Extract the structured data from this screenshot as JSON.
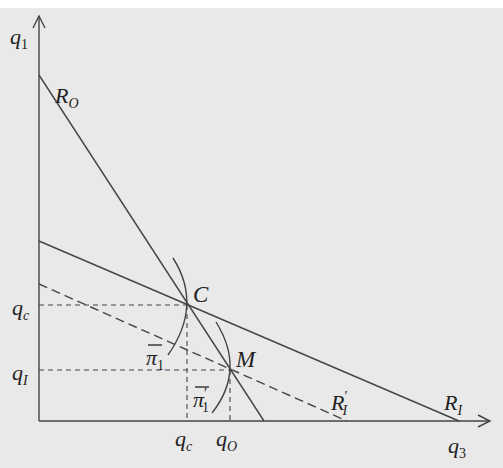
{
  "diagram": {
    "colors": {
      "background": "#e9e9e9",
      "ink": "#444444",
      "text": "#222222"
    },
    "axes": {
      "y_label": "q1",
      "x_label": "q3",
      "origin": [
        39,
        421
      ],
      "y_tip": [
        39,
        16
      ],
      "x_tip": [
        490,
        421
      ]
    },
    "lines": [
      {
        "id": "R_O",
        "label_main": "R",
        "label_sub": "O",
        "style": "solid",
        "from": [
          39,
          75
        ],
        "to": [
          264,
          421
        ],
        "label_pos": [
          52,
          103
        ]
      },
      {
        "id": "R_I",
        "label_main": "R",
        "label_sub": "I",
        "style": "solid",
        "from": [
          39,
          241
        ],
        "to": [
          459,
          421
        ],
        "label_pos": [
          444,
          410
        ]
      },
      {
        "id": "R_I_prime",
        "label_main": "R",
        "label_sub": "I",
        "label_prime": "′",
        "style": "dashed",
        "from": [
          39,
          284
        ],
        "to": [
          347,
          421
        ],
        "label_pos": [
          331,
          410
        ]
      }
    ],
    "points": [
      {
        "id": "C",
        "label": "C",
        "pos": [
          187,
          305
        ],
        "label_pos": [
          193,
          302
        ]
      },
      {
        "id": "M",
        "label": "M",
        "pos": [
          230,
          370
        ],
        "label_pos": [
          236,
          367
        ]
      }
    ],
    "guides": [
      {
        "from": [
          39,
          305
        ],
        "to": [
          187,
          305
        ]
      },
      {
        "from": [
          187,
          305
        ],
        "to": [
          187,
          421
        ]
      },
      {
        "from": [
          39,
          370
        ],
        "to": [
          230,
          370
        ]
      },
      {
        "from": [
          230,
          370
        ],
        "to": [
          230,
          421
        ]
      }
    ],
    "arcs": [
      {
        "id": "pi1",
        "label": "π",
        "label_sub": "1",
        "path": "M173,258 Q203,305 168,355",
        "label_pos": [
          146,
          365
        ]
      },
      {
        "id": "pi1_prime",
        "label": "π",
        "label_sub": "1",
        "label_prime": "′",
        "path": "M216,322 Q246,370 212,413",
        "label_pos": [
          193,
          407
        ]
      }
    ],
    "y_ticks": [
      {
        "main": "q",
        "sub": "c",
        "pos": [
          12,
          318
        ]
      },
      {
        "main": "q",
        "sub": "I",
        "pos": [
          12,
          383
        ]
      }
    ],
    "x_ticks": [
      {
        "main": "q",
        "sub": "c",
        "pos": [
          175,
          448
        ]
      },
      {
        "main": "q",
        "sub": "O",
        "pos": [
          216,
          448
        ]
      }
    ]
  }
}
